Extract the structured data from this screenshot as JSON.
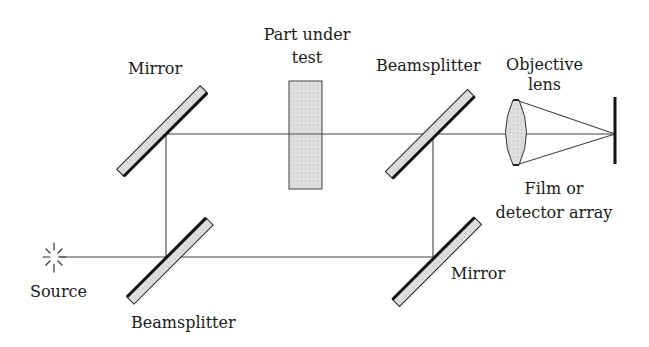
{
  "diagram": {
    "type": "optical-schematic",
    "colors": {
      "line": "#333333",
      "component_fill": "#d9d9d9",
      "component_edge": "#111111",
      "background": "#ffffff"
    },
    "labels": {
      "mirror_top": "Mirror",
      "part_line1": "Part under",
      "part_line2": "test",
      "beamsplitter_top": "Beamsplitter",
      "objective_line1": "Objective",
      "objective_line2": "lens",
      "film_line1": "Film or",
      "film_line2": "detector array",
      "mirror_bottom": "Mirror",
      "source": "Source",
      "beamsplitter_bottom": "Beamsplitter"
    },
    "components": [
      {
        "id": "source",
        "label": "Source",
        "kind": "light-source"
      },
      {
        "id": "beamsplitter-bottom-left",
        "label": "Beamsplitter",
        "kind": "beamsplitter"
      },
      {
        "id": "mirror-top-left",
        "label": "Mirror",
        "kind": "mirror"
      },
      {
        "id": "part-under-test",
        "label": "Part under test",
        "kind": "sample"
      },
      {
        "id": "mirror-bottom-right",
        "label": "Mirror",
        "kind": "mirror"
      },
      {
        "id": "beamsplitter-top-right",
        "label": "Beamsplitter",
        "kind": "beamsplitter"
      },
      {
        "id": "objective-lens",
        "label": "Objective lens",
        "kind": "lens"
      },
      {
        "id": "detector",
        "label": "Film or detector array",
        "kind": "detector"
      }
    ],
    "beam_paths": [
      {
        "from": "source",
        "to": "beamsplitter-bottom-left"
      },
      {
        "from": "beamsplitter-bottom-left",
        "to": "mirror-top-left"
      },
      {
        "from": "mirror-top-left",
        "to": "part-under-test"
      },
      {
        "from": "part-under-test",
        "to": "beamsplitter-top-right"
      },
      {
        "from": "beamsplitter-bottom-left",
        "to": "mirror-bottom-right"
      },
      {
        "from": "mirror-bottom-right",
        "to": "beamsplitter-top-right"
      },
      {
        "from": "beamsplitter-top-right",
        "to": "objective-lens"
      },
      {
        "from": "objective-lens",
        "to": "detector"
      }
    ]
  }
}
